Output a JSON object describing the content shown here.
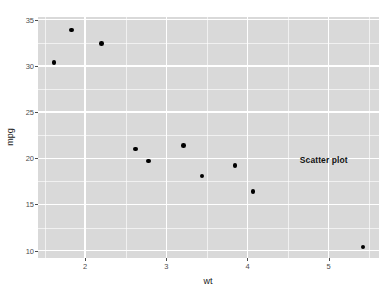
{
  "chart_data": {
    "type": "scatter",
    "title": "",
    "xlabel": "wt",
    "ylabel": "mpg",
    "xlim": [
      1.42,
      5.62
    ],
    "ylim": [
      9.2,
      35.3
    ],
    "xticks": [
      2,
      3,
      4,
      5
    ],
    "xtick_labels": [
      "2",
      "3",
      "4",
      "5"
    ],
    "yticks": [
      10,
      15,
      20,
      25,
      30,
      35
    ],
    "ytick_labels": [
      "10",
      "15",
      "20",
      "25",
      "30",
      "35"
    ],
    "grid": true,
    "legend": "none",
    "theme": "grey",
    "panel_background": "#d9d9d9",
    "gridline_color": "#ffffff",
    "point_color": "#000000",
    "point_size": 4.6,
    "points": [
      {
        "wt": 1.615,
        "mpg": 30.4
      },
      {
        "wt": 1.835,
        "mpg": 33.9
      },
      {
        "wt": 2.2,
        "mpg": 32.4
      },
      {
        "wt": 2.62,
        "mpg": 21.0
      },
      {
        "wt": 2.78,
        "mpg": 19.7
      },
      {
        "wt": 3.215,
        "mpg": 21.4
      },
      {
        "wt": 3.44,
        "mpg": 18.1
      },
      {
        "wt": 3.845,
        "mpg": 19.2
      },
      {
        "wt": 4.07,
        "mpg": 16.4
      },
      {
        "wt": 5.424,
        "mpg": 10.4
      }
    ],
    "annotations": [
      {
        "text": "Scatter plot",
        "wt": 4.94,
        "mpg": 19.8,
        "bold": true,
        "color": "#111111"
      }
    ]
  }
}
